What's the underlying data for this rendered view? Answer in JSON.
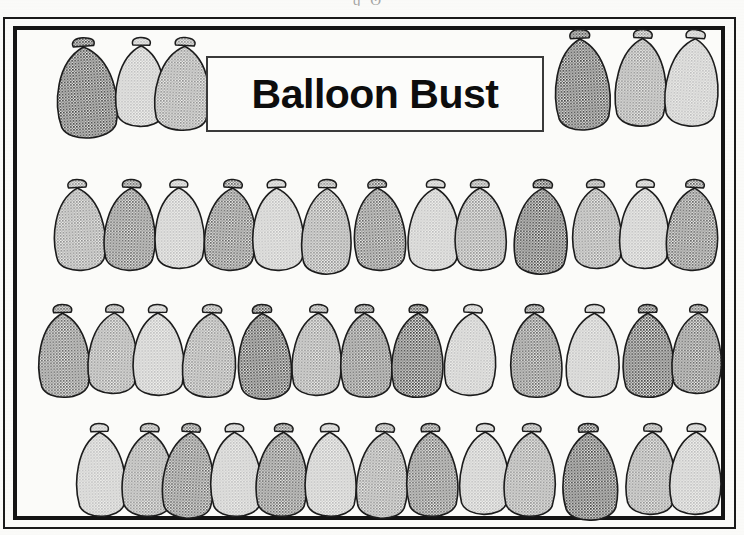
{
  "document": {
    "title": "Balloon Bust",
    "kind": "worksheet-illustration",
    "scan_artifact_text": "ɡ  ʘ       ҆"
  },
  "title_plate": {
    "label": "Balloon Bust"
  },
  "palette": {
    "ink": "#141414",
    "paper": "#fbfbf9",
    "outline": "#1c1c1c",
    "shade_very_dark": "#3b3b3b",
    "shade_dark": "#5e5e5e",
    "shade_medium": "#8d8d8d",
    "shade_light": "#bdbdbd",
    "shade_pale": "#d2d2d2"
  },
  "balloons": {
    "total_count": 45,
    "shade_names": [
      "very_dark",
      "dark",
      "medium",
      "light",
      "pale"
    ],
    "rows": [
      {
        "name": "row-top-left",
        "count": 3,
        "y": 38,
        "items": [
          {
            "x": 55,
            "w": 68,
            "h": 104,
            "shade": "very_dark",
            "tilt": -4
          },
          {
            "x": 112,
            "w": 56,
            "h": 92,
            "shade": "light",
            "tilt": 1
          },
          {
            "x": 150,
            "w": 62,
            "h": 96,
            "shade": "medium",
            "tilt": 3
          }
        ]
      },
      {
        "name": "row-top-right",
        "count": 3,
        "y": 30,
        "items": [
          {
            "x": 553,
            "w": 62,
            "h": 104,
            "shade": "very_dark",
            "tilt": -3
          },
          {
            "x": 611,
            "w": 58,
            "h": 100,
            "shade": "medium",
            "tilt": 2
          },
          {
            "x": 660,
            "w": 60,
            "h": 100,
            "shade": "light",
            "tilt": 4
          }
        ]
      },
      {
        "name": "row-2",
        "count": 13,
        "y": 180,
        "items": [
          {
            "x": 52,
            "w": 58,
            "h": 94,
            "shade": "medium",
            "tilt": -3
          },
          {
            "x": 100,
            "w": 58,
            "h": 94,
            "shade": "dark",
            "tilt": 2
          },
          {
            "x": 152,
            "w": 56,
            "h": 92,
            "shade": "light",
            "tilt": -1
          },
          {
            "x": 200,
            "w": 58,
            "h": 94,
            "shade": "dark",
            "tilt": 3
          },
          {
            "x": 250,
            "w": 58,
            "h": 94,
            "shade": "light",
            "tilt": -2
          },
          {
            "x": 298,
            "w": 56,
            "h": 98,
            "shade": "medium",
            "tilt": 1
          },
          {
            "x": 352,
            "w": 58,
            "h": 94,
            "shade": "dark",
            "tilt": -3
          },
          {
            "x": 404,
            "w": 58,
            "h": 94,
            "shade": "light",
            "tilt": 2
          },
          {
            "x": 452,
            "w": 58,
            "h": 94,
            "shade": "medium",
            "tilt": -1
          },
          {
            "x": 510,
            "w": 60,
            "h": 98,
            "shade": "very_dark",
            "tilt": 2
          },
          {
            "x": 570,
            "w": 56,
            "h": 92,
            "shade": "medium",
            "tilt": -2
          },
          {
            "x": 616,
            "w": 56,
            "h": 92,
            "shade": "light",
            "tilt": 1
          },
          {
            "x": 662,
            "w": 58,
            "h": 94,
            "shade": "dark",
            "tilt": 3
          }
        ]
      },
      {
        "name": "row-3",
        "count": 13,
        "y": 305,
        "items": [
          {
            "x": 36,
            "w": 58,
            "h": 96,
            "shade": "dark",
            "tilt": -2
          },
          {
            "x": 84,
            "w": 56,
            "h": 92,
            "shade": "medium",
            "tilt": 2
          },
          {
            "x": 130,
            "w": 58,
            "h": 94,
            "shade": "light",
            "tilt": -1
          },
          {
            "x": 178,
            "w": 60,
            "h": 96,
            "shade": "medium",
            "tilt": 3
          },
          {
            "x": 236,
            "w": 60,
            "h": 98,
            "shade": "very_dark",
            "tilt": -3
          },
          {
            "x": 288,
            "w": 56,
            "h": 94,
            "shade": "medium",
            "tilt": 2
          },
          {
            "x": 338,
            "w": 58,
            "h": 96,
            "shade": "dark",
            "tilt": -2
          },
          {
            "x": 388,
            "w": 58,
            "h": 96,
            "shade": "very_dark",
            "tilt": 1
          },
          {
            "x": 440,
            "w": 58,
            "h": 94,
            "shade": "light",
            "tilt": 3
          },
          {
            "x": 508,
            "w": 58,
            "h": 96,
            "shade": "dark",
            "tilt": -2
          },
          {
            "x": 562,
            "w": 60,
            "h": 96,
            "shade": "light",
            "tilt": 2
          },
          {
            "x": 620,
            "w": 58,
            "h": 96,
            "shade": "very_dark",
            "tilt": -1
          },
          {
            "x": 668,
            "w": 56,
            "h": 92,
            "shade": "dark",
            "tilt": 2
          }
        ]
      },
      {
        "name": "row-4",
        "count": 13,
        "y": 424,
        "items": [
          {
            "x": 74,
            "w": 56,
            "h": 96,
            "shade": "light",
            "tilt": -2
          },
          {
            "x": 118,
            "w": 58,
            "h": 96,
            "shade": "medium",
            "tilt": 2
          },
          {
            "x": 158,
            "w": 58,
            "h": 98,
            "shade": "dark",
            "tilt": 3
          },
          {
            "x": 208,
            "w": 58,
            "h": 96,
            "shade": "light",
            "tilt": -2
          },
          {
            "x": 252,
            "w": 58,
            "h": 96,
            "shade": "dark",
            "tilt": 2
          },
          {
            "x": 302,
            "w": 58,
            "h": 96,
            "shade": "light",
            "tilt": -1
          },
          {
            "x": 352,
            "w": 58,
            "h": 98,
            "shade": "medium",
            "tilt": 3
          },
          {
            "x": 404,
            "w": 58,
            "h": 96,
            "shade": "dark",
            "tilt": -2
          },
          {
            "x": 456,
            "w": 56,
            "h": 94,
            "shade": "light",
            "tilt": 1
          },
          {
            "x": 500,
            "w": 58,
            "h": 96,
            "shade": "medium",
            "tilt": 2
          },
          {
            "x": 560,
            "w": 62,
            "h": 100,
            "shade": "very_dark",
            "tilt": -2
          },
          {
            "x": 622,
            "w": 56,
            "h": 94,
            "shade": "medium",
            "tilt": 2
          },
          {
            "x": 666,
            "w": 58,
            "h": 94,
            "shade": "light",
            "tilt": 1
          }
        ]
      }
    ]
  }
}
